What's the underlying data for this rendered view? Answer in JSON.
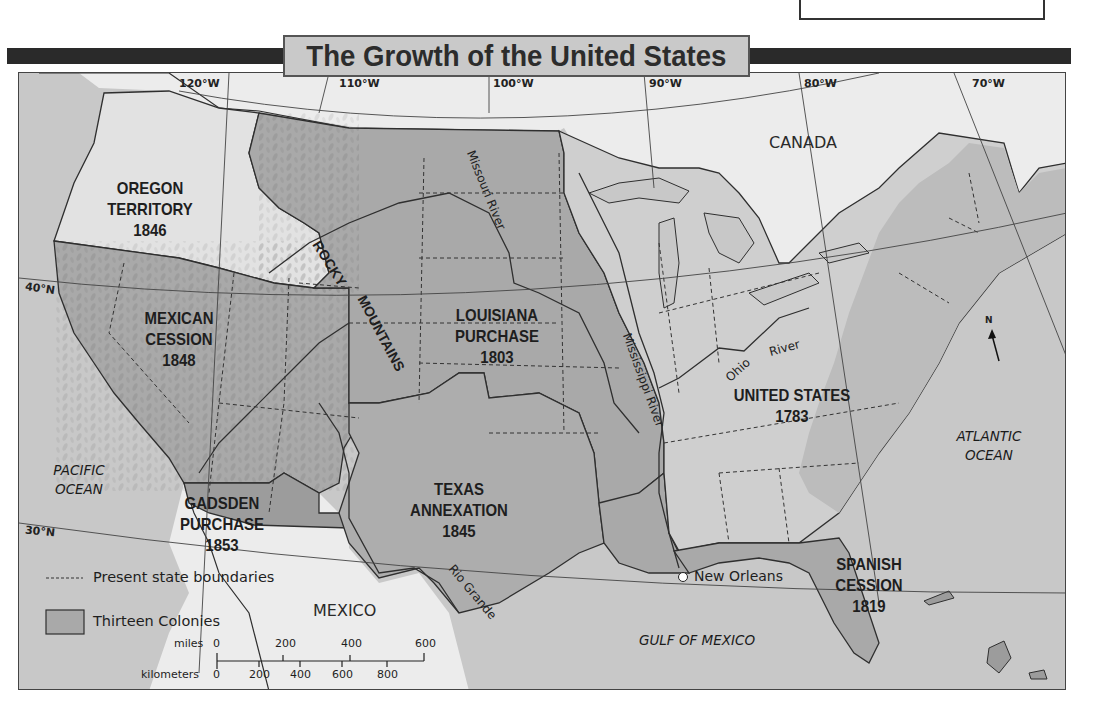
{
  "corner_note": {
    "text": "chase."
  },
  "map": {
    "title": "The Growth of the United States",
    "colors": {
      "ocean": "#c8c8c8",
      "foreign_land": "#ececec",
      "original_us": "#cfcfcf",
      "acquisition": "#a9a9a9",
      "oregon_territory": "#e2e2e2",
      "gadsden": "#9c9c9c",
      "border": "#2f2f2f",
      "title_bar": "#2a2a2a",
      "title_box": "#c9c9c9"
    },
    "longitudes": [
      "120°W",
      "110°W",
      "100°W",
      "90°W",
      "80°W",
      "70°W"
    ],
    "latitudes": [
      "40°N",
      "30°N"
    ],
    "regions": [
      {
        "id": "oregon",
        "lines": [
          "OREGON",
          "TERRITORY",
          "1846"
        ]
      },
      {
        "id": "mexican-cession",
        "lines": [
          "MEXICAN",
          "CESSION",
          "1848"
        ]
      },
      {
        "id": "louisiana",
        "lines": [
          "LOUISIANA",
          "PURCHASE",
          "1803"
        ]
      },
      {
        "id": "united-states",
        "lines": [
          "UNITED STATES",
          "1783"
        ]
      },
      {
        "id": "texas",
        "lines": [
          "TEXAS",
          "ANNEXATION",
          "1845"
        ]
      },
      {
        "id": "gadsden",
        "lines": [
          "GADSDEN",
          "PURCHASE",
          "1853"
        ]
      },
      {
        "id": "spanish-cession",
        "lines": [
          "SPANISH",
          "CESSION",
          "1819"
        ]
      }
    ],
    "places": {
      "canada": "CANADA",
      "mexico": "MEXICO",
      "pacific": [
        "PACIFIC",
        "OCEAN"
      ],
      "atlantic": [
        "ATLANTIC",
        "OCEAN"
      ],
      "gulf": "GULF OF MEXICO",
      "new_orleans": "New Orleans",
      "rocky": [
        "ROCKY",
        "MOUNTAINS"
      ]
    },
    "rivers": {
      "missouri": "Missouri River",
      "mississippi": "Mississippi River",
      "ohio": "Ohio",
      "ohio_river": "River",
      "rio_grande": "Rio Grande"
    },
    "compass": {
      "label": "N"
    },
    "legend": {
      "items": [
        {
          "symbol": "dashed-line",
          "label": "Present state boundaries"
        },
        {
          "symbol": "gray-box",
          "label": "Thirteen Colonies"
        }
      ]
    },
    "scale": {
      "miles_label": "miles",
      "miles_ticks": [
        "0",
        "200",
        "400",
        "600"
      ],
      "km_label": "kilometers",
      "km_ticks": [
        "0",
        "200",
        "400",
        "600",
        "800"
      ]
    }
  }
}
